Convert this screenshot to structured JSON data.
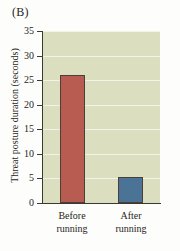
{
  "figure": {
    "panel_label": "(B)"
  },
  "chart_data": {
    "type": "bar",
    "title": "",
    "xlabel": "",
    "ylabel": "Threat posture duration (seconds)",
    "categories": [
      "Before running",
      "After running"
    ],
    "category_lines": [
      [
        "Before",
        "running"
      ],
      [
        "After",
        "running"
      ]
    ],
    "values": [
      26,
      5.2
    ],
    "ylim": [
      0,
      35
    ],
    "yticks": [
      0,
      5,
      10,
      15,
      20,
      25,
      30,
      35
    ],
    "ytick_labels": [
      "0",
      "5",
      "10",
      "15",
      "20",
      "25",
      "30",
      "35"
    ],
    "grid": true,
    "legend": null,
    "bar_colors": [
      "#b85c52",
      "#4a7396"
    ],
    "plot_background": "#dcdec0",
    "gridline_color": "#f2f3e4",
    "axis_color": "#3a3a32",
    "bar_border_color": "#4a4038"
  }
}
